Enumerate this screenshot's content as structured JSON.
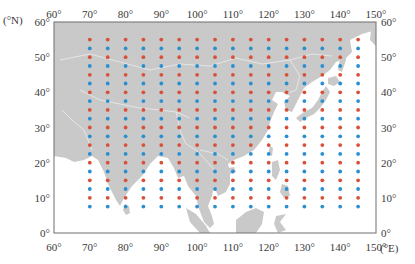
{
  "map": {
    "projection": "equirectangular",
    "extent": {
      "lon_min": 60,
      "lon_max": 150,
      "lat_min": 0,
      "lat_max": 60
    },
    "frame_px": {
      "left": 54,
      "top": 22,
      "right": 376,
      "bottom": 233
    },
    "colors": {
      "land": "#c9c9c9",
      "water": "#ffffff",
      "frame": "#6e6e6e",
      "borders": "#e8e8e8",
      "series_a": "#d9503a",
      "series_b": "#2a8fd0"
    }
  },
  "axes": {
    "x_unit": "(°E)",
    "y_unit": "(°N)",
    "x_ticks_top": [
      "60°",
      "70°",
      "80°",
      "90°",
      "100°",
      "110°",
      "120°",
      "130°",
      "140°",
      "150°"
    ],
    "x_ticks_bottom": [
      "60°",
      "70°",
      "80°",
      "90°",
      "100°",
      "110°",
      "120°",
      "130°",
      "140°",
      "150°"
    ],
    "y_ticks_left": [
      "60°",
      "50°",
      "40°",
      "30°",
      "20°",
      "10°",
      "0°"
    ],
    "y_ticks_right": [
      "60°",
      "50°",
      "40°",
      "30°",
      "20°",
      "10°",
      "0°"
    ]
  },
  "chart_data": {
    "type": "scatter",
    "title": "",
    "xlabel": "(°E)",
    "ylabel": "(°N)",
    "xlim": [
      60,
      150
    ],
    "ylim": [
      0,
      60
    ],
    "grid": false,
    "series": [
      {
        "name": "red points",
        "color": "#d9503a",
        "lons": [
          70,
          75,
          80,
          85,
          90,
          95,
          100,
          105,
          110,
          115,
          120,
          125,
          130,
          135,
          140,
          145
        ],
        "lats": [
          55,
          50,
          45,
          40,
          35,
          30,
          25,
          20,
          15,
          10
        ]
      },
      {
        "name": "blue points",
        "color": "#2a8fd0",
        "lons": [
          70,
          75,
          80,
          85,
          90,
          95,
          100,
          105,
          110,
          115,
          120,
          125,
          130,
          135,
          140,
          145
        ],
        "lats": [
          52.5,
          47.5,
          42.5,
          37.5,
          32.5,
          27.5,
          22.5,
          17.5,
          12.5,
          7.5
        ]
      }
    ]
  }
}
